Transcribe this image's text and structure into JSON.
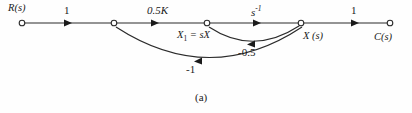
{
  "figure": {
    "caption": "(a)",
    "type": "signal-flow-graph",
    "line_color": "#2b2b2b",
    "text_color": "#1a1a1a",
    "background": "#fefefe"
  },
  "nodes": [
    {
      "id": "R",
      "label": "R(s)",
      "x": 22,
      "y": 23,
      "label_x": 8,
      "label_y": 4
    },
    {
      "id": "N2",
      "label": "",
      "x": 114,
      "y": 23,
      "label_x": 0,
      "label_y": 0
    },
    {
      "id": "X1",
      "label": "X1 = sX",
      "x": 207,
      "y": 23,
      "label_x": 178,
      "label_y": 30
    },
    {
      "id": "X",
      "label": "X (s)",
      "x": 301,
      "y": 23,
      "label_x": 303,
      "label_y": 31
    },
    {
      "id": "C",
      "label": "C(s)",
      "x": 390,
      "y": 23,
      "label_x": 375,
      "label_y": 32
    }
  ],
  "node_labels": {
    "source": "R(s)",
    "x1_base": "X",
    "x1_subscript": "1",
    "x1_equals": " = sX",
    "state": "X (s)",
    "output": "C(s)"
  },
  "forward_branches": [
    {
      "from": "R",
      "to": "N2",
      "gain": "1",
      "label_x": 63,
      "label_y": 5,
      "arrow_x": 68,
      "italic": false
    },
    {
      "from": "N2",
      "to": "X1",
      "gain": "0.5K",
      "label_x": 148,
      "label_y": 5,
      "arrow_x": 155,
      "italic": true
    },
    {
      "from": "X1",
      "to": "X",
      "gain": "s",
      "superscript": "-1",
      "label_x": 251,
      "label_y": 5,
      "arrow_x": 257,
      "italic": true
    },
    {
      "from": "X",
      "to": "C",
      "gain": "1",
      "label_x": 350,
      "label_y": 5,
      "arrow_x": 355,
      "italic": false
    }
  ],
  "feedback_branches": [
    {
      "from": "X",
      "to": "X1",
      "gain": "-0.5",
      "label_x": 242,
      "label_y": 48
    },
    {
      "from": "X",
      "to": "N2",
      "gain": "-1",
      "label_x": 188,
      "label_y": 68
    }
  ]
}
